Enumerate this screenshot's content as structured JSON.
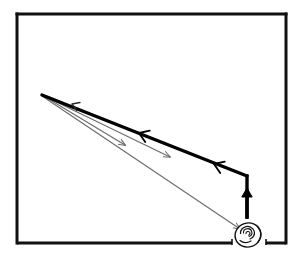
{
  "figure": {
    "title": "Ray reflection diagram with observer's eye",
    "background_color": "#ffffff",
    "ink_color": "#000000",
    "thin_ink_color": "#555555"
  },
  "frame": {
    "name": "enclosing-rectangle",
    "left": 17,
    "top": 14,
    "right": 286,
    "bottom": 243,
    "stroke_width": 3,
    "color": "#111111",
    "bottom_gap": {
      "label": "gap-for-eye",
      "from_x": 232,
      "to_x": 266
    }
  },
  "convergence_point": {
    "name": "virtual-image-point",
    "x": 42,
    "y": 95
  },
  "thick_ray": {
    "name": "principal-thick-ray",
    "color": "#000000",
    "stroke_width": 3.4,
    "points": [
      {
        "x": 42,
        "y": 95
      },
      {
        "x": 247,
        "y": 176
      }
    ],
    "corner": {
      "x": 247,
      "y": 176
    },
    "vertical_end": {
      "x": 247,
      "y": 219
    },
    "arrowheads": [
      {
        "x": 139,
        "y": 133,
        "direction": "up-left"
      },
      {
        "x": 214,
        "y": 164,
        "direction": "up-left"
      }
    ]
  },
  "vertical_arrow": {
    "name": "upward-object-arrow",
    "x": 247,
    "from_y": 218,
    "to_y": 188,
    "color": "#000000",
    "stroke_width": 3.4,
    "head_direction": "up"
  },
  "thin_rays": [
    {
      "name": "thin-ray-upper",
      "from": {
        "x": 42,
        "y": 95
      },
      "to": {
        "x": 170,
        "y": 157
      },
      "color": "#6a6a6a",
      "stroke_width": 1.1,
      "arrowhead": {
        "x": 168,
        "y": 156,
        "direction": "down-right"
      }
    },
    {
      "name": "thin-ray-lower",
      "from": {
        "x": 42,
        "y": 96
      },
      "to": {
        "x": 240,
        "y": 229
      },
      "color": "#6a6a6a",
      "stroke_width": 1.1,
      "arrowhead": {
        "x": 239,
        "y": 228,
        "direction": "down-right"
      }
    },
    {
      "name": "thin-ray-back-upper",
      "from": {
        "x": 42,
        "y": 95
      },
      "to": {
        "x": 125,
        "y": 145
      },
      "color": "#6a6a6a",
      "stroke_width": 1.1,
      "arrowhead": {
        "x": 124,
        "y": 144,
        "direction": "down-right"
      }
    }
  ],
  "small_arrowheads": [
    {
      "name": "left-pointing-tick-arrow",
      "x": 72,
      "y": 104,
      "direction": "up-left"
    }
  ],
  "eye": {
    "name": "observer-eye",
    "center_x": 248,
    "center_y": 235,
    "radius_x": 13,
    "radius_y": 12,
    "color": "#111111",
    "stroke_width": 1.4,
    "label": "eye"
  },
  "ticks": [
    {
      "name": "bottom-gap-tick-left",
      "x": 232,
      "y": 243
    },
    {
      "name": "bottom-gap-tick-right",
      "x": 266,
      "y": 243
    }
  ]
}
